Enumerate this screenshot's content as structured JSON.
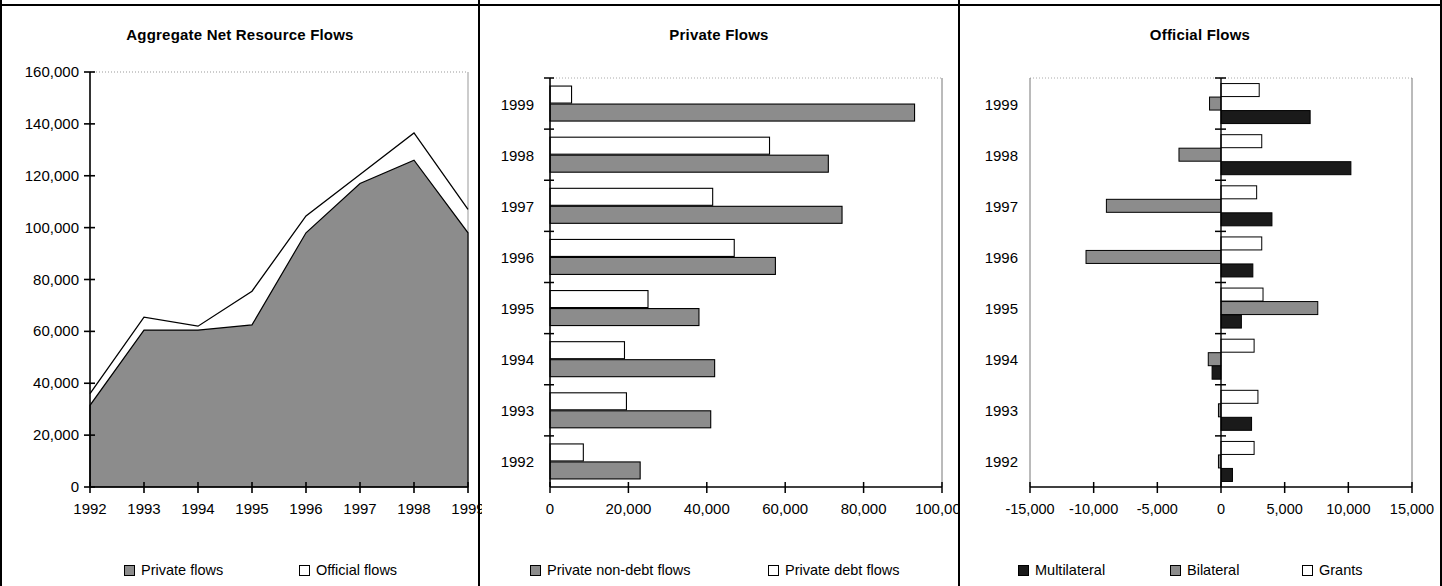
{
  "figure": {
    "panel_count": 3
  },
  "panels": [
    {
      "title": "Aggregate Net Resource Flows",
      "legend": [
        {
          "label": "Private flows",
          "swatch": "gray"
        },
        {
          "label": "Official flows",
          "swatch": "white"
        }
      ]
    },
    {
      "title": "Private Flows",
      "legend": [
        {
          "label": "Private non-debt flows",
          "swatch": "gray"
        },
        {
          "label": "Private debt flows",
          "swatch": "white"
        }
      ]
    },
    {
      "title": "Official Flows",
      "legend": [
        {
          "label": "Multilateral",
          "swatch": "black"
        },
        {
          "label": "Bilateral",
          "swatch": "gray"
        },
        {
          "label": "Grants",
          "swatch": "white"
        }
      ]
    }
  ],
  "chart_data": [
    {
      "type": "area",
      "title": "Aggregate Net Resource Flows",
      "xlabel": "",
      "ylabel": "",
      "x": [
        "1992",
        "1993",
        "1994",
        "1995",
        "1996",
        "1997",
        "1998",
        "1999"
      ],
      "xticklabels": [
        "1992",
        "1993",
        "1994",
        "1995",
        "1996",
        "1997",
        "1998",
        "1999"
      ],
      "yticklabels": [
        "0",
        "20,000",
        "40,000",
        "60,000",
        "80,000",
        "100,000",
        "120,000",
        "140,000",
        "160,000"
      ],
      "yticks": [
        0,
        20000,
        40000,
        60000,
        80000,
        100000,
        120000,
        140000,
        160000
      ],
      "ylim": [
        0,
        160000
      ],
      "grid": false,
      "stacked": true,
      "series": [
        {
          "name": "Private flows",
          "fill": "gray",
          "values": [
            31500,
            60500,
            60500,
            62500,
            98000,
            117000,
            126000,
            98000
          ]
        },
        {
          "name": "Official flows",
          "fill": "white",
          "values": [
            4500,
            5000,
            1500,
            13000,
            6500,
            3500,
            10500,
            9000
          ]
        }
      ],
      "totals": [
        36000,
        65500,
        62000,
        75500,
        104500,
        120500,
        136500,
        107000
      ],
      "legend_position": "bottom"
    },
    {
      "type": "bar",
      "orientation": "horizontal",
      "title": "Private Flows",
      "xlabel": "",
      "ylabel": "",
      "categories": [
        "1992",
        "1993",
        "1994",
        "1995",
        "1996",
        "1997",
        "1998",
        "1999"
      ],
      "xticks": [
        0,
        20000,
        40000,
        60000,
        80000,
        100000
      ],
      "xticklabels": [
        "0",
        "20,000",
        "40,000",
        "60,000",
        "80,000",
        "100,000"
      ],
      "xlim": [
        0,
        100000
      ],
      "grid": false,
      "series": [
        {
          "name": "Private non-debt flows",
          "fill": "gray",
          "values": [
            23000,
            41000,
            42000,
            38000,
            57500,
            74500,
            71000,
            93000
          ]
        },
        {
          "name": "Private debt flows",
          "fill": "white",
          "values": [
            8500,
            19500,
            19000,
            25000,
            47000,
            41500,
            56000,
            5500
          ]
        }
      ],
      "legend_position": "bottom"
    },
    {
      "type": "bar",
      "orientation": "horizontal",
      "title": "Official Flows",
      "xlabel": "",
      "ylabel": "",
      "categories": [
        "1992",
        "1993",
        "1994",
        "1995",
        "1996",
        "1997",
        "1998",
        "1999"
      ],
      "xticks": [
        -15000,
        -10000,
        -5000,
        0,
        5000,
        10000,
        15000
      ],
      "xticklabels": [
        "-15,000",
        "-10,000",
        "-5,000",
        "0",
        "5,000",
        "10,000",
        "15,000"
      ],
      "xlim": [
        -15000,
        15000
      ],
      "grid": false,
      "series": [
        {
          "name": "Multilateral",
          "fill": "black",
          "values": [
            900,
            2400,
            -700,
            1600,
            2500,
            4000,
            10200,
            7000
          ]
        },
        {
          "name": "Bilateral",
          "fill": "gray",
          "values": [
            -200,
            -200,
            -1000,
            7600,
            -10600,
            -9000,
            -3300,
            -900
          ]
        },
        {
          "name": "Grants",
          "fill": "white",
          "values": [
            2600,
            2900,
            2600,
            3300,
            3200,
            2800,
            3200,
            3000
          ]
        }
      ],
      "legend_position": "bottom"
    }
  ]
}
